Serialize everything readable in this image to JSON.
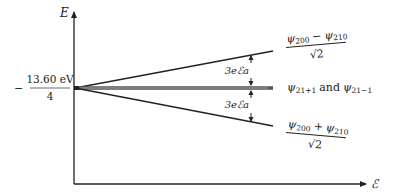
{
  "figure": {
    "type": "energy-level diagram (Stark effect, n=2 hydrogen)",
    "axes": {
      "y_label": "E",
      "x_label": "ℰ"
    },
    "reference_level": {
      "sign": "−",
      "numerator": "13.60 eV",
      "denominator": "4"
    },
    "splitting_labels": {
      "upper": "3eℰa",
      "lower": "3eℰa"
    },
    "levels": [
      {
        "id": "upper",
        "label_numerator_psi1": "ψ",
        "label_numerator_sub1": "200",
        "label_numerator_op": "−",
        "label_numerator_psi2": "ψ",
        "label_numerator_sub2": "210",
        "label_denominator": "√2"
      },
      {
        "id": "middle",
        "label_psi1": "ψ",
        "label_sub1": "21+1",
        "label_and": "and",
        "label_psi2": "ψ",
        "label_sub2": "21−1"
      },
      {
        "id": "lower",
        "label_numerator_psi1": "ψ",
        "label_numerator_sub1": "200",
        "label_numerator_op": "+",
        "label_numerator_psi2": "ψ",
        "label_numerator_sub2": "210",
        "label_denominator": "√2"
      }
    ],
    "colors": {
      "ink": "#222222",
      "middle_band": "#555555",
      "middle_band_highlight": "#bbbbbb"
    }
  }
}
